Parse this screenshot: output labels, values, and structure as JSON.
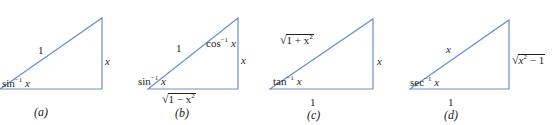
{
  "figure": {
    "line_color": "#6b8fce",
    "text_color": "#231f20",
    "triangles": [
      {
        "id": "a",
        "caption": "(a)",
        "hypotenuse": "1",
        "opposite": "x",
        "angle_label_bottom": "sin",
        "angle_exp": "−1",
        "angle_var": "x"
      },
      {
        "id": "b",
        "caption": "(b)",
        "hypotenuse": "1",
        "opposite": "x",
        "adjacent_prefix": "1 − x",
        "adjacent_exp": "2",
        "angle_label_bottom": "sin",
        "angle_exp": "−1",
        "angle_var": "x",
        "angle_label_top": "cos",
        "angle_top_exp": "−1",
        "angle_top_var": "x"
      },
      {
        "id": "c",
        "caption": "(c)",
        "hypotenuse_prefix": "1 + x",
        "hypotenuse_exp": "2",
        "opposite": "x",
        "adjacent": "1",
        "angle_label_bottom": "tan",
        "angle_exp": "−1",
        "angle_var": "x"
      },
      {
        "id": "d",
        "caption": "(d)",
        "hypotenuse": "x",
        "opposite_var": "x",
        "opposite_exp": "2",
        "opposite_suffix": " − 1",
        "adjacent": "1",
        "angle_label_bottom": "sec",
        "angle_exp": "−1",
        "angle_var": "x"
      }
    ]
  }
}
